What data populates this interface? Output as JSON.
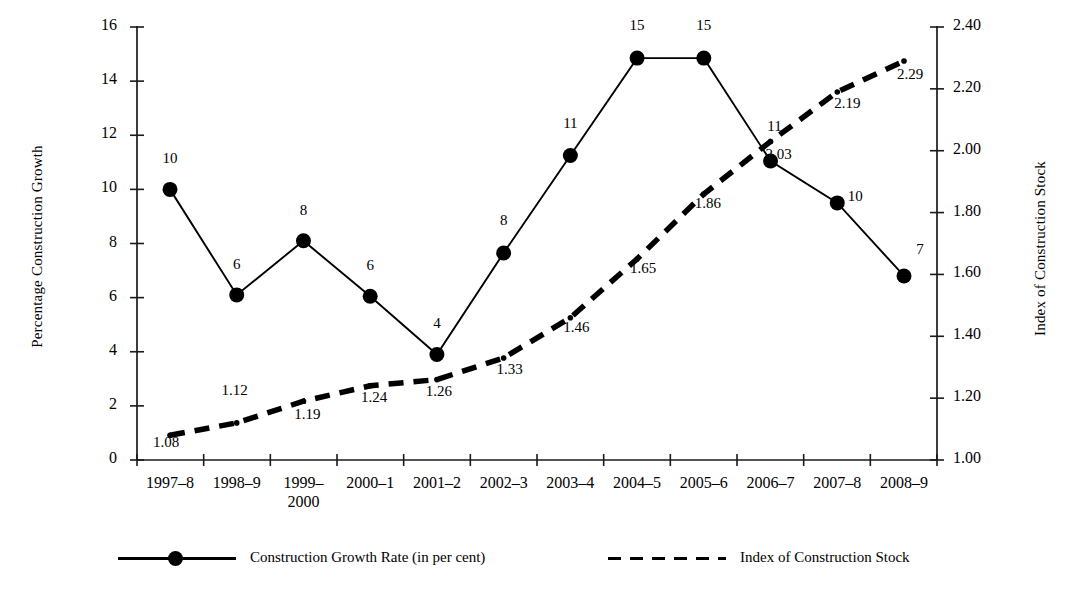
{
  "chart_data": {
    "type": "line",
    "title": "",
    "xlabel": "",
    "ylabel": "Percentage Construction Growth",
    "y2label": "Index of Construction Stock",
    "grid": false,
    "legend_position": "bottom",
    "ylim": [
      0,
      16
    ],
    "ytick_step": 2,
    "y2lim": [
      1.0,
      2.4
    ],
    "y2tick_step": 0.2,
    "categories": [
      "1997–8",
      "1998–9",
      "1999–\n2000",
      "2000–1",
      "2001–2",
      "2002–3",
      "2003–4",
      "2004–5",
      "2005–6",
      "2006–7",
      "2007–8",
      "2008–9"
    ],
    "yticks": [
      "0",
      "2",
      "4",
      "6",
      "8",
      "10",
      "12",
      "14",
      "16"
    ],
    "y2ticks": [
      "1.00",
      "1.20",
      "1.40",
      "1.60",
      "1.80",
      "2.00",
      "2.20",
      "2.40"
    ],
    "series": [
      {
        "name": "Construction Growth Rate (in per cent)",
        "axis": "left",
        "style": "solid",
        "marker": "circle",
        "color": "#000000",
        "values": [
          10.0,
          6.1,
          8.1,
          6.05,
          3.9,
          7.65,
          11.25,
          14.85,
          14.85,
          11.05,
          9.5,
          6.8
        ],
        "labels": [
          "10",
          "6",
          "8",
          "6",
          "4",
          "8",
          "11",
          "15",
          "15",
          "11",
          "10",
          "7"
        ]
      },
      {
        "name": "Index of Construction Stock",
        "axis": "right",
        "style": "dashed",
        "marker": "dot",
        "color": "#000000",
        "values": [
          1.08,
          1.12,
          1.19,
          1.24,
          1.26,
          1.33,
          1.46,
          1.65,
          1.86,
          2.03,
          2.19,
          2.29
        ],
        "labels": [
          "1.08",
          "1.12",
          "1.19",
          "1.24",
          "1.26",
          "1.33",
          "1.46",
          "1.65",
          "1.86",
          "2.03",
          "2.19",
          "2.29"
        ]
      }
    ]
  },
  "legend": {
    "items": [
      {
        "label": "Construction Growth Rate (in per cent)",
        "style": "solid-marker"
      },
      {
        "label": "Index of Construction Stock",
        "style": "dashed"
      }
    ]
  }
}
